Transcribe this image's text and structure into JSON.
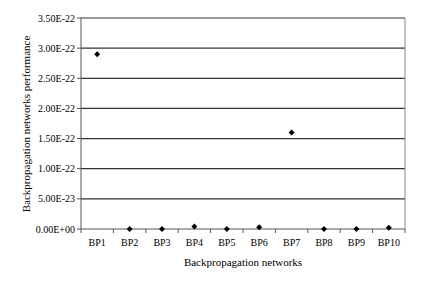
{
  "chart_data": {
    "type": "scatter",
    "title": "",
    "xlabel": "Backpropagation networks",
    "ylabel": "Backpropagation networks performance",
    "categories": [
      "BP1",
      "BP2",
      "BP3",
      "BP4",
      "BP5",
      "BP6",
      "BP7",
      "BP8",
      "BP9",
      "BP10"
    ],
    "values": [
      2.9e-22,
      0,
      0,
      4e-24,
      0,
      3e-24,
      1.6e-22,
      0,
      0,
      2e-24
    ],
    "ylim": [
      0,
      3.5e-22
    ],
    "yticks": [
      0,
      5e-23,
      1e-22,
      1.5e-22,
      2e-22,
      2.5e-22,
      3e-22,
      3.5e-22
    ],
    "ytick_labels": [
      "0.00E+00",
      "5.00E-23",
      "1.00E-22",
      "1.50E-22",
      "2.00E-22",
      "2.50E-22",
      "3.00E-22",
      "3.50E-22"
    ],
    "grid": true,
    "legend": null,
    "marker": "diamond",
    "colors": {
      "marker": "#000000",
      "grid": "#333333",
      "axis": "#555555"
    }
  }
}
